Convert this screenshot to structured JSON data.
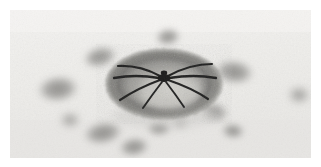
{
  "figure": {
    "medium": "grayscale pencil and charcoal drawing",
    "alt_text": "A dark spider-like form with eight radiating legs rests at the centre of a large mottled oval disc, encircled by about a dozen soft-edged grey blobs on pale paper.",
    "width": 321,
    "height": 167
  },
  "canvas": {
    "page_background": "#ffffff",
    "paper_background": "#f1f0ee",
    "paper_shadow": "#e3e2df",
    "paper_rect": {
      "x": 10,
      "y": 10,
      "width": 301,
      "height": 148
    },
    "grain_opacity": 0.5,
    "grain_color": "#b9b8b4"
  },
  "central_disc": {
    "name": "central-disc",
    "cx": 164,
    "cy": 84,
    "rx": 56,
    "ry": 33,
    "rim_color": "#6f6f6d",
    "rim_color_outer": "#8d8d8a",
    "body_color": "#a9a8a4",
    "highlight_color": "#d2d1cc",
    "highlight_cx": 170,
    "highlight_cy": 92,
    "highlight_rx": 30,
    "highlight_ry": 18,
    "rim_thickness": 11,
    "shadow_color": "#c9c8c4"
  },
  "spider": {
    "name": "spider-figure",
    "hub_x": 164,
    "hub_y": 78,
    "body_color": "#1d1d1c",
    "leg_color": "#232322",
    "body_rx": 6.5,
    "body_ry": 4.0,
    "leg_count": 8,
    "legs": [
      {
        "id": "leg-front-left",
        "x1": 160,
        "y1": 76,
        "cx": 140,
        "cy": 65,
        "x2": 118,
        "y2": 66,
        "w": 2.1
      },
      {
        "id": "leg-mid-left",
        "x1": 159,
        "y1": 78,
        "cx": 136,
        "cy": 74,
        "x2": 114,
        "y2": 78,
        "w": 2.3
      },
      {
        "id": "leg-rear-left",
        "x1": 160,
        "y1": 80,
        "cx": 138,
        "cy": 88,
        "x2": 120,
        "y2": 100,
        "w": 2.2
      },
      {
        "id": "leg-back-left",
        "x1": 162,
        "y1": 82,
        "cx": 152,
        "cy": 95,
        "x2": 143,
        "y2": 108,
        "w": 1.9
      },
      {
        "id": "leg-front-right",
        "x1": 168,
        "y1": 76,
        "cx": 190,
        "cy": 64,
        "x2": 212,
        "y2": 64,
        "w": 2.1
      },
      {
        "id": "leg-mid-right",
        "x1": 169,
        "y1": 78,
        "cx": 194,
        "cy": 74,
        "x2": 216,
        "y2": 78,
        "w": 2.3
      },
      {
        "id": "leg-rear-right",
        "x1": 168,
        "y1": 80,
        "cx": 192,
        "cy": 88,
        "x2": 208,
        "y2": 99,
        "w": 2.2
      },
      {
        "id": "leg-back-right",
        "x1": 166,
        "y1": 82,
        "cx": 176,
        "cy": 95,
        "x2": 184,
        "y2": 107,
        "w": 1.9
      }
    ]
  },
  "blobs": [
    {
      "id": "blob-top-center",
      "cx": 168,
      "cy": 37,
      "rx": 13,
      "ry": 9,
      "rot": -8,
      "tone": "#9d9c99"
    },
    {
      "id": "blob-upper-left",
      "cx": 100,
      "cy": 57,
      "rx": 18,
      "ry": 11,
      "rot": -14,
      "tone": "#93928f"
    },
    {
      "id": "blob-left-mid",
      "cx": 58,
      "cy": 89,
      "rx": 22,
      "ry": 14,
      "rot": -6,
      "tone": "#8f8e8b"
    },
    {
      "id": "blob-right-upper",
      "cx": 234,
      "cy": 72,
      "rx": 21,
      "ry": 13,
      "rot": 7,
      "tone": "#8c8b88"
    },
    {
      "id": "blob-right-mid",
      "cx": 214,
      "cy": 112,
      "rx": 15,
      "ry": 10,
      "rot": 12,
      "tone": "#989794"
    },
    {
      "id": "blob-right-lower",
      "cx": 233,
      "cy": 131,
      "rx": 12,
      "ry": 8,
      "rot": 5,
      "tone": "#9b9a97"
    },
    {
      "id": "blob-bottom-center",
      "cx": 159,
      "cy": 128,
      "rx": 13,
      "ry": 8,
      "rot": -4,
      "tone": "#9a9996"
    },
    {
      "id": "blob-bottom-small",
      "cx": 180,
      "cy": 122,
      "rx": 8,
      "ry": 6,
      "rot": 0,
      "tone": "#a6a5a2"
    },
    {
      "id": "blob-lower-left",
      "cx": 103,
      "cy": 133,
      "rx": 21,
      "ry": 12,
      "rot": -10,
      "tone": "#8e8d8a"
    },
    {
      "id": "blob-lower-left-2",
      "cx": 134,
      "cy": 147,
      "rx": 16,
      "ry": 10,
      "rot": -8,
      "tone": "#92918e"
    },
    {
      "id": "blob-far-left-low",
      "cx": 70,
      "cy": 120,
      "rx": 10,
      "ry": 7,
      "rot": 0,
      "tone": "#a3a29f"
    },
    {
      "id": "blob-edge-right",
      "cx": 299,
      "cy": 95,
      "rx": 11,
      "ry": 8,
      "rot": 0,
      "tone": "#a8a7a4"
    }
  ],
  "labels": {
    "figure_name": "spider-illustration",
    "subject": "Spider",
    "background_note": "textured paper"
  }
}
